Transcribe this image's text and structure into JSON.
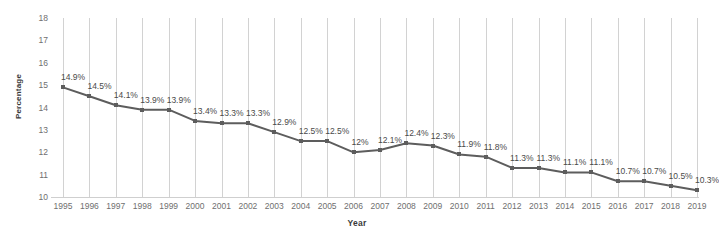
{
  "chart_data": {
    "type": "line",
    "title": "",
    "xlabel": "Year",
    "ylabel": "Percentage",
    "ylim": [
      10,
      18
    ],
    "yticks": [
      10,
      11,
      12,
      13,
      14,
      15,
      16,
      17,
      18
    ],
    "grid": "vertical",
    "legend": "none",
    "series_color": "#5d5d5d",
    "categories": [
      "1995",
      "1996",
      "1997",
      "1998",
      "1999",
      "2000",
      "2001",
      "2002",
      "2003",
      "2004",
      "2005",
      "2006",
      "2007",
      "2008",
      "2009",
      "2010",
      "2011",
      "2012",
      "2013",
      "2014",
      "2015",
      "2016",
      "2017",
      "2018",
      "2019"
    ],
    "values": [
      14.9,
      14.5,
      14.1,
      13.9,
      13.9,
      13.4,
      13.3,
      13.3,
      12.9,
      12.5,
      12.5,
      12.0,
      12.1,
      12.4,
      12.3,
      11.9,
      11.8,
      11.3,
      11.3,
      11.1,
      11.1,
      10.7,
      10.7,
      10.5,
      10.3
    ],
    "point_labels": [
      "14.9%",
      "14.5%",
      "14.1%",
      "13.9%",
      "13.9%",
      "13.4%",
      "13.3%",
      "13.3%",
      "12.9%",
      "12.5%",
      "12.5%",
      "12%",
      "12.1%",
      "12.4%",
      "12.3%",
      "11.9%",
      "11.8%",
      "11.3%",
      "11.3%",
      "11.1%",
      "11.1%",
      "10.7%",
      "10.7%",
      "10.5%",
      "10.3%"
    ]
  }
}
